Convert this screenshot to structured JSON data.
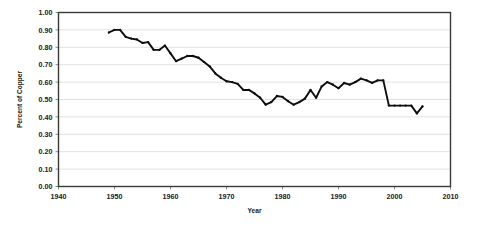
{
  "chart_data": {
    "type": "line",
    "title": "",
    "xlabel": "Year",
    "ylabel": "Percent of Copper",
    "xlim": [
      1940,
      2010
    ],
    "ylim": [
      0.0,
      1.0
    ],
    "xticks": [
      1940,
      1950,
      1960,
      1970,
      1980,
      1990,
      2000,
      2010
    ],
    "xtick_labels": [
      "1940",
      "1950",
      "1960",
      "1970",
      "1980",
      "1990",
      "2000",
      "2010"
    ],
    "yticks": [
      0.0,
      0.1,
      0.2,
      0.3,
      0.4,
      0.5,
      0.6,
      0.7,
      0.8,
      0.9,
      1.0
    ],
    "ytick_labels": [
      "0.00",
      "0.10",
      "0.20",
      "0.30",
      "0.40",
      "0.50",
      "0.60",
      "0.70",
      "0.80",
      "0.90",
      "1.00"
    ],
    "grid": true,
    "grid_axis": "y",
    "legend": false,
    "legend_position": "none",
    "line_color": "#0d0d0d",
    "grid_color": "#d9d9d9",
    "frame_color": "#3a3a3a",
    "background_color": "#ffffff",
    "marker": "dot",
    "series": [
      {
        "name": "Percent of Copper",
        "x": [
          1949,
          1950,
          1951,
          1952,
          1953,
          1954,
          1955,
          1956,
          1957,
          1958,
          1959,
          1960,
          1961,
          1962,
          1963,
          1964,
          1965,
          1966,
          1967,
          1968,
          1969,
          1970,
          1971,
          1972,
          1973,
          1974,
          1975,
          1976,
          1977,
          1978,
          1979,
          1980,
          1981,
          1982,
          1983,
          1984,
          1985,
          1986,
          1987,
          1988,
          1989,
          1990,
          1991,
          1992,
          1993,
          1994,
          1995,
          1996,
          1997,
          1998,
          1999,
          2000,
          2001,
          2002,
          2003,
          2004,
          2005
        ],
        "values": [
          0.885,
          0.9,
          0.9,
          0.86,
          0.85,
          0.845,
          0.825,
          0.83,
          0.785,
          0.785,
          0.81,
          0.765,
          0.72,
          0.735,
          0.75,
          0.75,
          0.74,
          0.715,
          0.69,
          0.65,
          0.625,
          0.605,
          0.6,
          0.59,
          0.555,
          0.555,
          0.535,
          0.51,
          0.47,
          0.485,
          0.52,
          0.515,
          0.49,
          0.47,
          0.485,
          0.505,
          0.555,
          0.51,
          0.575,
          0.6,
          0.585,
          0.565,
          0.595,
          0.585,
          0.6,
          0.62,
          0.61,
          0.595,
          0.61,
          0.61,
          0.465,
          0.465,
          0.465,
          0.465,
          0.465,
          0.42,
          0.46
        ],
        "note": "approximate values read from plotted line"
      }
    ],
    "data_points_xy": [
      [
        1949,
        0.885
      ],
      [
        1950,
        0.9
      ],
      [
        1951,
        0.9
      ],
      [
        1952,
        0.86
      ],
      [
        1953,
        0.85
      ],
      [
        1954,
        0.845
      ],
      [
        1955,
        0.825
      ],
      [
        1956,
        0.83
      ],
      [
        1957,
        0.785
      ],
      [
        1958,
        0.785
      ],
      [
        1959,
        0.81
      ],
      [
        1960,
        0.765
      ],
      [
        1961,
        0.72
      ],
      [
        1962,
        0.735
      ],
      [
        1963,
        0.75
      ],
      [
        1964,
        0.75
      ],
      [
        1965,
        0.74
      ],
      [
        1966,
        0.715
      ],
      [
        1967,
        0.69
      ],
      [
        1968,
        0.65
      ],
      [
        1969,
        0.625
      ],
      [
        1970,
        0.605
      ],
      [
        1971,
        0.6
      ],
      [
        1972,
        0.59
      ],
      [
        1973,
        0.555
      ],
      [
        1974,
        0.555
      ],
      [
        1975,
        0.535
      ],
      [
        1976,
        0.51
      ],
      [
        1977,
        0.47
      ],
      [
        1978,
        0.485
      ],
      [
        1979,
        0.52
      ],
      [
        1980,
        0.515
      ],
      [
        1981,
        0.49
      ],
      [
        1982,
        0.47
      ],
      [
        1983,
        0.485
      ],
      [
        1984,
        0.505
      ],
      [
        1985,
        0.555
      ],
      [
        1986,
        0.51
      ],
      [
        1987,
        0.575
      ],
      [
        1988,
        0.6
      ],
      [
        1989,
        0.585
      ],
      [
        1990,
        0.565
      ],
      [
        1991,
        0.595
      ],
      [
        1992,
        0.585
      ],
      [
        1993,
        0.6
      ],
      [
        1994,
        0.62
      ],
      [
        1995,
        0.61
      ],
      [
        1996,
        0.595
      ],
      [
        1997,
        0.61
      ],
      [
        1998,
        0.61
      ],
      [
        1999,
        0.465
      ],
      [
        2000,
        0.465
      ],
      [
        2001,
        0.465
      ],
      [
        2002,
        0.465
      ],
      [
        2003,
        0.465
      ],
      [
        2004,
        0.42
      ],
      [
        2005,
        0.46
      ]
    ]
  }
}
